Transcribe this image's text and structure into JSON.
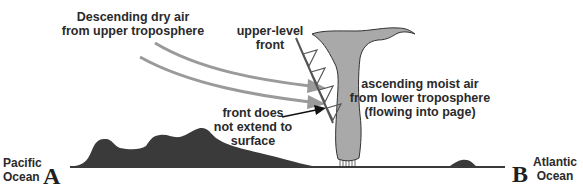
{
  "labels": {
    "descending_line1": "Descending dry air",
    "descending_line2": "from  upper troposphere",
    "upper_front_line1": "upper-level",
    "upper_front_line2": "front",
    "ascending_line1": "ascending moist air",
    "ascending_line2": "from  lower troposphere",
    "ascending_line3": "(flowing into page)",
    "front_surface_line1": "front does",
    "front_surface_line2": "not extend to",
    "front_surface_line3": "surface",
    "west_ocean_line1": "Pacific",
    "west_ocean_line2": "Ocean",
    "west_point": "A",
    "east_ocean_line1": "Atlantic",
    "east_ocean_line2": "Ocean",
    "east_point": "B"
  },
  "colors": {
    "cloud_fill": "#a9a9a9",
    "arrow_gray": "#9a9a9a",
    "terrain": "#3a3a3a",
    "text": "#2a2a2a"
  }
}
